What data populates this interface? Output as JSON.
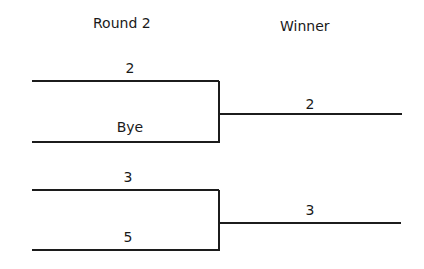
{
  "headers": {
    "round": "Round 2",
    "winner": "Winner"
  },
  "matches": [
    {
      "top": "2",
      "bottom": "Bye",
      "winner": "2"
    },
    {
      "top": "3",
      "bottom": "5",
      "winner": "3"
    }
  ]
}
